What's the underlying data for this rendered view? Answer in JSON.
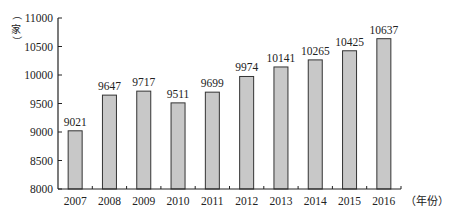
{
  "chart_data": {
    "type": "bar",
    "title": "",
    "xlabel": "（年份）",
    "ylabel": "（家）",
    "categories": [
      "2007",
      "2008",
      "2009",
      "2010",
      "2011",
      "2012",
      "2013",
      "2014",
      "2015",
      "2016"
    ],
    "values": [
      9021,
      9647,
      9717,
      9511,
      9699,
      9974,
      10141,
      10265,
      10425,
      10637
    ],
    "data_labels": [
      "9021",
      "9647",
      "9717",
      "9511",
      "9699",
      "9974",
      "10141",
      "10265",
      "10425",
      "10637"
    ],
    "ylim": [
      8000,
      11000
    ],
    "yticks": [
      8000,
      8500,
      9000,
      9500,
      10000,
      10500,
      11000
    ],
    "ytick_labels": [
      "8000",
      "8500",
      "9000",
      "9500",
      "10000",
      "10500",
      "11000"
    ],
    "grid": false,
    "legend": null,
    "colors": {
      "bar_fill": "#c8c8c8",
      "bar_stroke": "#333333",
      "axis": "#222222"
    }
  }
}
